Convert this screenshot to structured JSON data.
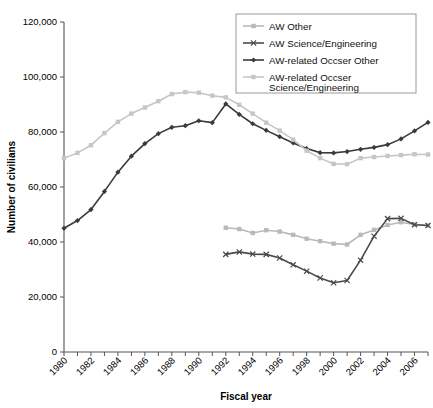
{
  "chart_data": {
    "type": "line",
    "title": "",
    "xlabel": "Fiscal year",
    "ylabel": "Number of civilians",
    "xlim": [
      1980,
      2007
    ],
    "ylim": [
      0,
      120000
    ],
    "ytick_labels": [
      "0",
      "20,000",
      "40,000",
      "60,000",
      "80,000",
      "100,000",
      "120,000"
    ],
    "ytick_values": [
      0,
      20000,
      40000,
      60000,
      80000,
      100000,
      120000
    ],
    "xtick_labels": [
      "1980",
      "1982",
      "1984",
      "1986",
      "1988",
      "1990",
      "1992",
      "1994",
      "1996",
      "1998",
      "2000",
      "2002",
      "2004",
      "2006"
    ],
    "xtick_values": [
      1980,
      1982,
      1984,
      1986,
      1988,
      1990,
      1992,
      1994,
      1996,
      1998,
      2000,
      2002,
      2004,
      2006
    ],
    "grid": false,
    "legend_position": "top-right",
    "colors": {
      "aw_other": "#b9b9b9",
      "aw_science_engineering": "#4a4a4a",
      "aw_related_occser_other": "#3a3a3a",
      "aw_related_occser_science_engineering": "#c6c6c6"
    },
    "series": [
      {
        "name": "AW Other",
        "marker": "square",
        "color": "#b9b9b9",
        "x": [
          1992,
          1993,
          1994,
          1995,
          1996,
          1997,
          1998,
          1999,
          2000,
          2001,
          2002,
          2003,
          2004,
          2005,
          2006,
          2007
        ],
        "values": [
          45200,
          44700,
          43300,
          44300,
          43800,
          42600,
          41200,
          40300,
          39400,
          39100,
          42600,
          44400,
          46200,
          47200,
          46400,
          46000
        ]
      },
      {
        "name": "AW Science/Engineering",
        "marker": "x",
        "color": "#4a4a4a",
        "x": [
          1992,
          1993,
          1994,
          1995,
          1996,
          1997,
          1998,
          1999,
          2000,
          2001,
          2002,
          2003,
          2004,
          2005,
          2006,
          2007
        ],
        "values": [
          35500,
          36400,
          35600,
          35500,
          34200,
          31700,
          29400,
          26900,
          25200,
          26000,
          33400,
          42100,
          48500,
          48600,
          46300,
          46000
        ]
      },
      {
        "name": "AW-related Occser Other",
        "marker": "diamond",
        "color": "#3a3a3a",
        "x": [
          1980,
          1981,
          1982,
          1983,
          1984,
          1985,
          1986,
          1987,
          1988,
          1989,
          1990,
          1991,
          1992,
          1993,
          1994,
          1995,
          1996,
          1997,
          1998,
          1999,
          2000,
          2001,
          2002,
          2003,
          2004,
          2005,
          2006,
          2007
        ],
        "values": [
          45000,
          47800,
          51800,
          58400,
          65400,
          71200,
          75800,
          79400,
          81700,
          82300,
          84100,
          83400,
          90200,
          86400,
          83000,
          80600,
          78300,
          76000,
          74000,
          72500,
          72400,
          72900,
          73700,
          74400,
          75400,
          77500,
          80400,
          83500
        ]
      },
      {
        "name": "AW-related Occser Science/Engineering",
        "marker": "square",
        "color": "#c6c6c6",
        "x": [
          1980,
          1981,
          1982,
          1983,
          1984,
          1985,
          1986,
          1987,
          1988,
          1989,
          1990,
          1991,
          1992,
          1993,
          1994,
          1995,
          1996,
          1997,
          1998,
          1999,
          2000,
          2001,
          2002,
          2003,
          2004,
          2005,
          2006,
          2007
        ],
        "values": [
          70500,
          72400,
          75200,
          79600,
          83700,
          86700,
          88900,
          91200,
          93800,
          94500,
          94300,
          93200,
          92600,
          89900,
          86700,
          83400,
          80500,
          77200,
          73200,
          70500,
          68400,
          68300,
          70500,
          70900,
          71300,
          71600,
          71900,
          71800
        ]
      }
    ]
  },
  "legend": {
    "items": [
      {
        "label": "AW Other"
      },
      {
        "label": "AW Science/Engineering"
      },
      {
        "label": "AW-related Occser Other"
      },
      {
        "label": "AW-related Occser"
      },
      {
        "label": "Science/Engineering"
      }
    ]
  }
}
